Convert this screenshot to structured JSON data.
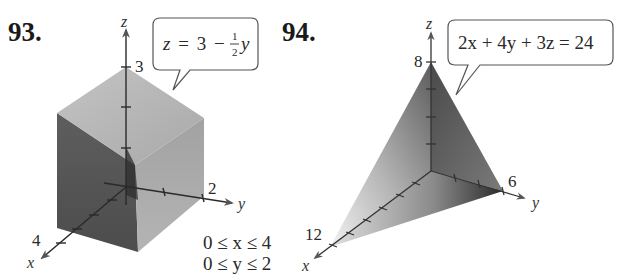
{
  "problems": [
    {
      "number": "93.",
      "callout": {
        "lhs": "z",
        "equals": "=",
        "const": "3",
        "minus": "−",
        "frac_num": "1",
        "frac_den": "2",
        "var": "y",
        "full_text": "z = 3 − ½y"
      },
      "axes": {
        "x": "x",
        "y": "y",
        "z": "z"
      },
      "tick_labels": {
        "x": "4",
        "y": "2",
        "z": "3"
      },
      "constraints": [
        "0 ≤ x ≤ 4",
        "0 ≤ y ≤ 2"
      ],
      "shape": "rectangular solid under plane"
    },
    {
      "number": "94.",
      "callout": {
        "full_text": "2x + 4y + 3z = 24"
      },
      "axes": {
        "x": "x",
        "y": "y",
        "z": "z"
      },
      "tick_labels": {
        "x": "12",
        "y": "6",
        "z": "8"
      },
      "shape": "tetrahedron bounded by plane and coordinate planes"
    }
  ],
  "colors": {
    "axis": "#2a2a2a",
    "box_top": "#b8b8b8",
    "box_left": "#5a5a5a",
    "box_right": "#9a9a9a",
    "callout_border": "#555555"
  }
}
